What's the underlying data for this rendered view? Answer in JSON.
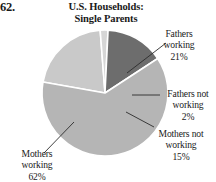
{
  "problem": {
    "number": "62."
  },
  "title": {
    "line1": "U.S. Households:",
    "line2": "Single Parents"
  },
  "chart_data": {
    "type": "pie",
    "title": "U.S. Households: Single Parents",
    "subtitle": "",
    "xlabel": "",
    "ylabel": "",
    "legend_position": "callout-labels",
    "grid": false,
    "categories": [
      "Fathers working",
      "Fathers not working",
      "Mothers not working",
      "Mothers working"
    ],
    "values": [
      21,
      2,
      15,
      62
    ],
    "value_unit": "%",
    "colors": [
      "#c9c9c9",
      "#d6d6d6",
      "#6d6d6d",
      "#b5b5b5"
    ],
    "slices": [
      {
        "label": "Fathers working",
        "label_line1": "Fathers",
        "label_line2": "working",
        "value": 21,
        "value_text": "21%",
        "color": "#c9c9c9"
      },
      {
        "label": "Fathers not working",
        "label_line1": "Fathers not",
        "label_line2": "working",
        "value": 2,
        "value_text": "2%",
        "color": "#d6d6d6"
      },
      {
        "label": "Mothers not working",
        "label_line1": "Mothers not",
        "label_line2": "working",
        "value": 15,
        "value_text": "15%",
        "color": "#6d6d6d"
      },
      {
        "label": "Mothers working",
        "label_line1": "Mothers",
        "label_line2": "working",
        "value": 62,
        "value_text": "62%",
        "color": "#b5b5b5"
      }
    ]
  }
}
